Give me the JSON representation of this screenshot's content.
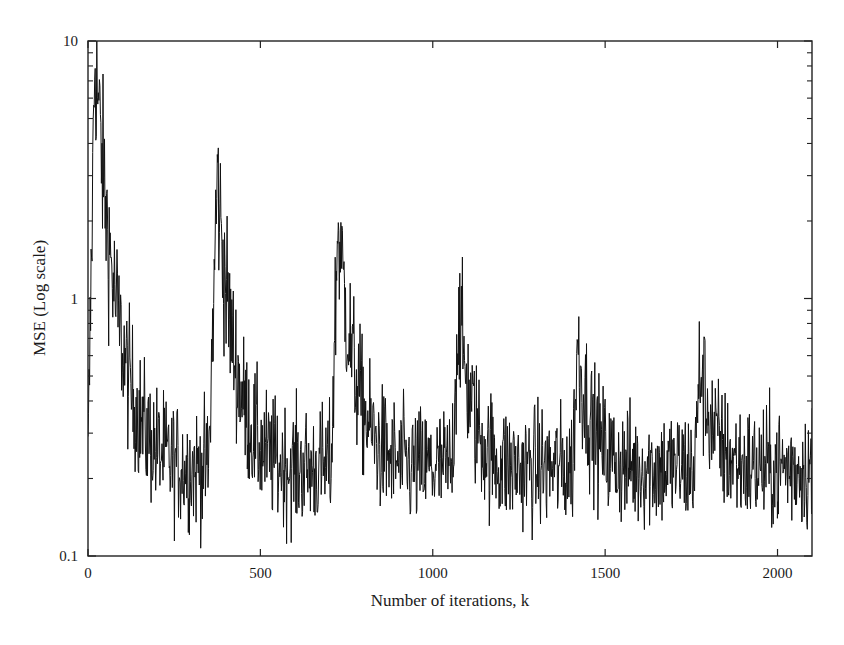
{
  "chart_data": {
    "type": "line",
    "title": "",
    "xlabel": "Number of iterations, k",
    "ylabel": "MSE (Log scale)",
    "xscale": "linear",
    "yscale": "log",
    "xlim": [
      0,
      2100
    ],
    "ylim": [
      0.1,
      10
    ],
    "x_ticks": [
      0,
      500,
      1000,
      1500,
      2000
    ],
    "x_tick_labels": [
      "0",
      "500",
      "1000",
      "1500",
      "2000"
    ],
    "y_ticks": [
      0.1,
      1,
      10
    ],
    "y_tick_labels": [
      "0.1",
      "1",
      "10"
    ],
    "grid": false,
    "legend": null,
    "line_color": "#111111",
    "series": [
      {
        "name": "MSE",
        "description": "Noisy learning curve: starts near 10, decays to a ~0.22 floor, then jumps at each abrupt system change and re-converges.",
        "baseline": 0.22,
        "noise_log10_amplitude": 0.12,
        "segments": [
          {
            "k_start": 0,
            "peak": 9.5,
            "k_peak": 20,
            "decay_to_floor_by": 300
          },
          {
            "k_start": 350,
            "peak": 3.0,
            "k_peak": 375,
            "decay_to_floor_by": 600
          },
          {
            "k_start": 705,
            "peak": 2.0,
            "k_peak": 725,
            "decay_to_floor_by": 950
          },
          {
            "k_start": 1055,
            "peak": 0.9,
            "k_peak": 1075,
            "decay_to_floor_by": 1250
          },
          {
            "k_start": 1405,
            "peak": 0.65,
            "k_peak": 1420,
            "decay_to_floor_by": 1600
          },
          {
            "k_start": 1760,
            "peak": 0.55,
            "k_peak": 1775,
            "decay_to_floor_by": 1950
          }
        ],
        "key_points": [
          {
            "k": 0,
            "mse": 9.5
          },
          {
            "k": 100,
            "mse": 1.2
          },
          {
            "k": 200,
            "mse": 0.32
          },
          {
            "k": 340,
            "mse": 0.22
          },
          {
            "k": 375,
            "mse": 3.0
          },
          {
            "k": 500,
            "mse": 0.45
          },
          {
            "k": 700,
            "mse": 0.2
          },
          {
            "k": 725,
            "mse": 1.9
          },
          {
            "k": 850,
            "mse": 0.35
          },
          {
            "k": 1050,
            "mse": 0.2
          },
          {
            "k": 1075,
            "mse": 0.85
          },
          {
            "k": 1200,
            "mse": 0.25
          },
          {
            "k": 1400,
            "mse": 0.2
          },
          {
            "k": 1420,
            "mse": 0.6
          },
          {
            "k": 1550,
            "mse": 0.22
          },
          {
            "k": 1760,
            "mse": 0.2
          },
          {
            "k": 1775,
            "mse": 0.5
          },
          {
            "k": 1900,
            "mse": 0.22
          },
          {
            "k": 2100,
            "mse": 0.22
          }
        ]
      }
    ]
  }
}
